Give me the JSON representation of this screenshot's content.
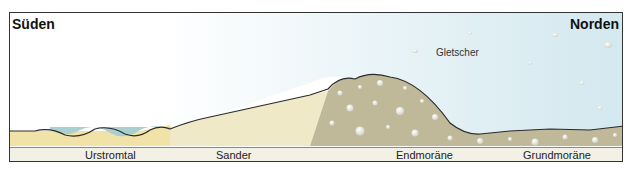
{
  "diagram": {
    "direction_left": "Süden",
    "direction_right": "Norden",
    "glacier_label": "Gletscher",
    "zones": [
      {
        "label": "Urstromtal"
      },
      {
        "label": "Sander"
      },
      {
        "label": "Endmoräne"
      },
      {
        "label": "Grundmoräne"
      }
    ],
    "colors": {
      "ice": "#dcecf2",
      "water": "#a9cfd0",
      "urstromtal_sand": "#f1e2a8",
      "sander_sand": "#efe9c8",
      "moraine": "#bfb99a",
      "outline": "#2a2a2a",
      "label_strip": "#f3f1e6"
    }
  }
}
